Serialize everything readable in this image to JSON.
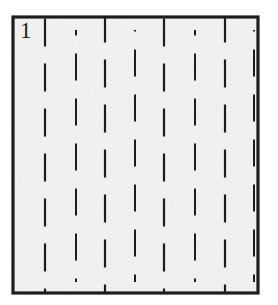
{
  "figure": {
    "label": "1",
    "caption_label_position": "top-left",
    "background_color": "#ffffff",
    "paper_color": "#f2f2f0",
    "ink_color": "#1d1d1d",
    "frame": {
      "name": "specimen-frame",
      "x": 13,
      "y": 17,
      "width": 245,
      "height": 276,
      "stroke_width": 3.2,
      "stroke_color": "#1d1d1d",
      "fill_color": "#f2f2f0"
    },
    "primary_columns": {
      "name": "primary-dashed-columns",
      "count": 4,
      "x_positions": [
        45,
        105,
        164,
        225
      ],
      "stroke_width": 2.2,
      "dash_length": 28,
      "gap_length": 17,
      "phase_offset": 0,
      "y_start": 17,
      "y_end": 293
    },
    "secondary_columns": {
      "name": "secondary-dashed-columns",
      "count": 4,
      "x_positions": [
        76,
        135,
        195,
        254
      ],
      "stroke_width": 2.0,
      "dash_length": 27,
      "gap_length": 18,
      "phase_offset": 23,
      "y_start": 30,
      "y_end": 282
    },
    "colors": {
      "ink": "#1d1d1d",
      "paper": "#f2f2f0",
      "page": "#ffffff",
      "speckle": "#d9d9d6"
    }
  }
}
